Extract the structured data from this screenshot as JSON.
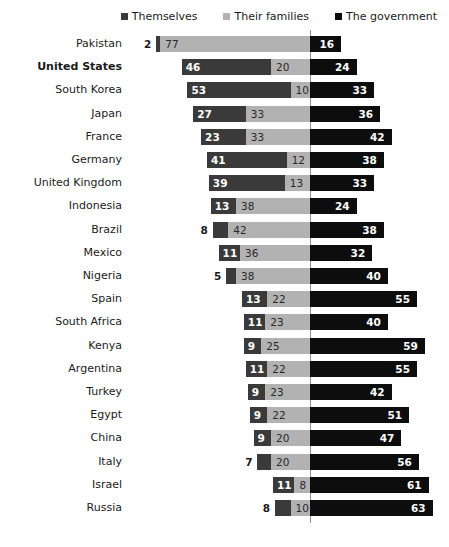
{
  "legend": {
    "items": [
      {
        "label": "Themselves",
        "color": "#3a3a3a",
        "key": "themselves"
      },
      {
        "label": "Their families",
        "color": "#b2b2b2",
        "key": "families"
      },
      {
        "label": "The government",
        "color": "#0d0d0d",
        "key": "government"
      }
    ]
  },
  "chart_data": {
    "type": "bar",
    "subtype": "diverging-stacked-bar",
    "title": "",
    "xlabel": "",
    "ylabel": "",
    "grid": false,
    "legend_position": "top-right",
    "axis_center": 0,
    "units": "percent",
    "series": [
      {
        "name": "Themselves",
        "side": "left",
        "color": "#3a3a3a",
        "values": [
          2,
          46,
          53,
          27,
          23,
          41,
          39,
          13,
          8,
          11,
          5,
          13,
          11,
          9,
          11,
          9,
          9,
          9,
          7,
          11,
          8
        ]
      },
      {
        "name": "Their families",
        "side": "left",
        "color": "#b2b2b2",
        "values": [
          77,
          20,
          10,
          33,
          33,
          12,
          13,
          38,
          42,
          36,
          38,
          22,
          23,
          25,
          22,
          23,
          22,
          20,
          20,
          8,
          10
        ]
      },
      {
        "name": "The government",
        "side": "right",
        "color": "#0d0d0d",
        "values": [
          16,
          24,
          33,
          36,
          42,
          38,
          33,
          24,
          38,
          32,
          40,
          55,
          40,
          59,
          55,
          42,
          51,
          47,
          56,
          61,
          63
        ]
      }
    ],
    "categories": [
      "Pakistan",
      "United States",
      "South Korea",
      "Japan",
      "France",
      "Germany",
      "United Kingdom",
      "Indonesia",
      "Brazil",
      "Mexico",
      "Nigeria",
      "Spain",
      "South Africa",
      "Kenya",
      "Argentina",
      "Turkey",
      "Egypt",
      "China",
      "Italy",
      "Israel",
      "Russia"
    ]
  },
  "rows": [
    {
      "label": "Pakistan",
      "highlight": false,
      "themselves": 2,
      "families": 77,
      "government": 16
    },
    {
      "label": "United States",
      "highlight": true,
      "themselves": 46,
      "families": 20,
      "government": 24
    },
    {
      "label": "South Korea",
      "highlight": false,
      "themselves": 53,
      "families": 10,
      "government": 33
    },
    {
      "label": "Japan",
      "highlight": false,
      "themselves": 27,
      "families": 33,
      "government": 36
    },
    {
      "label": "France",
      "highlight": false,
      "themselves": 23,
      "families": 33,
      "government": 42
    },
    {
      "label": "Germany",
      "highlight": false,
      "themselves": 41,
      "families": 12,
      "government": 38
    },
    {
      "label": "United Kingdom",
      "highlight": false,
      "themselves": 39,
      "families": 13,
      "government": 33
    },
    {
      "label": "Indonesia",
      "highlight": false,
      "themselves": 13,
      "families": 38,
      "government": 24
    },
    {
      "label": "Brazil",
      "highlight": false,
      "themselves": 8,
      "families": 42,
      "government": 38
    },
    {
      "label": "Mexico",
      "highlight": false,
      "themselves": 11,
      "families": 36,
      "government": 32
    },
    {
      "label": "Nigeria",
      "highlight": false,
      "themselves": 5,
      "families": 38,
      "government": 40
    },
    {
      "label": "Spain",
      "highlight": false,
      "themselves": 13,
      "families": 22,
      "government": 55
    },
    {
      "label": "South Africa",
      "highlight": false,
      "themselves": 11,
      "families": 23,
      "government": 40
    },
    {
      "label": "Kenya",
      "highlight": false,
      "themselves": 9,
      "families": 25,
      "government": 59
    },
    {
      "label": "Argentina",
      "highlight": false,
      "themselves": 11,
      "families": 22,
      "government": 55
    },
    {
      "label": "Turkey",
      "highlight": false,
      "themselves": 9,
      "families": 23,
      "government": 42
    },
    {
      "label": "Egypt",
      "highlight": false,
      "themselves": 9,
      "families": 22,
      "government": 51
    },
    {
      "label": "China",
      "highlight": false,
      "themselves": 9,
      "families": 20,
      "government": 47
    },
    {
      "label": "Italy",
      "highlight": false,
      "themselves": 7,
      "families": 20,
      "government": 56
    },
    {
      "label": "Israel",
      "highlight": false,
      "themselves": 11,
      "families": 8,
      "government": 61
    },
    {
      "label": "Russia",
      "highlight": false,
      "themselves": 8,
      "families": 10,
      "government": 63
    }
  ],
  "layout": {
    "axis_x": 310,
    "px_per_unit": 1.945,
    "row_pitch": 23.2,
    "row_top": 6,
    "bar_height": 16
  }
}
